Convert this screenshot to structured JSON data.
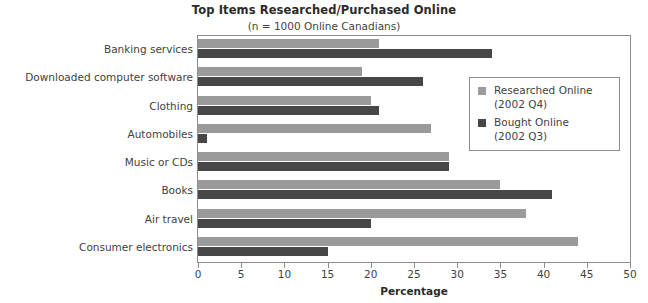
{
  "chart_data": {
    "type": "bar",
    "orientation": "horizontal",
    "title": "Top Items Researched/Purchased Online",
    "subtitle": "(n = 1000 Online Canadians)",
    "xlabel": "Percentage",
    "ylabel": "",
    "xlim": [
      0,
      50
    ],
    "xticks": [
      0,
      5,
      10,
      15,
      20,
      25,
      30,
      35,
      40,
      45,
      50
    ],
    "grid": false,
    "legend_position": "right-top",
    "categories": [
      "Banking services",
      "Downloaded computer software",
      "Clothing",
      "Automobiles",
      "Music or CDs",
      "Books",
      "Air travel",
      "Consumer electronics"
    ],
    "series": [
      {
        "name": "Researched Online",
        "sublabel": "(2002 Q4)",
        "color": "#9a9a9a",
        "values": [
          21,
          19,
          20,
          27,
          29,
          35,
          38,
          44
        ]
      },
      {
        "name": "Bought Online",
        "sublabel": "(2002 Q3)",
        "color": "#474747",
        "values": [
          34,
          26,
          21,
          1,
          29,
          41,
          20,
          15
        ]
      }
    ]
  },
  "colors": {
    "researched": "#9a9a9a",
    "bought": "#474747",
    "axis": "#8d8d8d",
    "text": "#3f3f3f",
    "background": "#ffffff"
  }
}
